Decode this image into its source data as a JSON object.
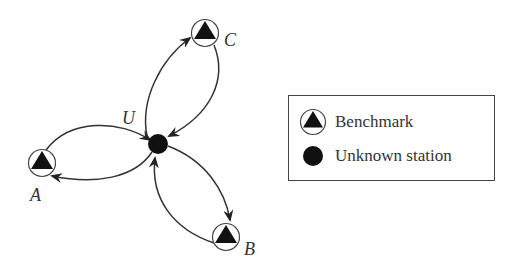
{
  "diagram": {
    "stations": [
      {
        "id": "A",
        "label": "A",
        "type": "benchmark"
      },
      {
        "id": "B",
        "label": "B",
        "type": "benchmark"
      },
      {
        "id": "C",
        "label": "C",
        "type": "benchmark"
      },
      {
        "id": "U",
        "label": "U",
        "type": "unknown"
      }
    ],
    "edges": [
      {
        "from": "A",
        "to": "U"
      },
      {
        "from": "U",
        "to": "A"
      },
      {
        "from": "U",
        "to": "B"
      },
      {
        "from": "B",
        "to": "U"
      },
      {
        "from": "U",
        "to": "C"
      },
      {
        "from": "C",
        "to": "U"
      }
    ],
    "labels": {
      "A": "A",
      "B": "B",
      "C": "C",
      "U": "U"
    }
  },
  "legend": {
    "items": [
      {
        "symbol": "benchmark-icon",
        "label": "Benchmark"
      },
      {
        "symbol": "unknown-station-icon",
        "label": "Unknown station"
      }
    ]
  },
  "colors": {
    "stroke": "#333333",
    "fill": "#111111",
    "background": "#ffffff"
  }
}
